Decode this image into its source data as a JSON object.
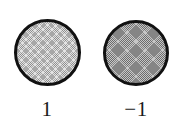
{
  "figure": {
    "background_color": "#ffffff",
    "width": 183,
    "height": 131,
    "outline_color": "#111111"
  },
  "nodes": [
    {
      "id": "disk-1",
      "label": "1",
      "shape": "circle",
      "fill_style": "crosshatch-light",
      "fill_color": "#e2e2e2",
      "center_x": 47,
      "center_y": 53,
      "diameter": 67
    },
    {
      "id": "disk-2",
      "label": "−1",
      "shape": "circle",
      "fill_style": "crosshatch-dark",
      "fill_color": "#c6c6c6",
      "center_x": 136,
      "center_y": 53,
      "diameter": 66
    }
  ]
}
